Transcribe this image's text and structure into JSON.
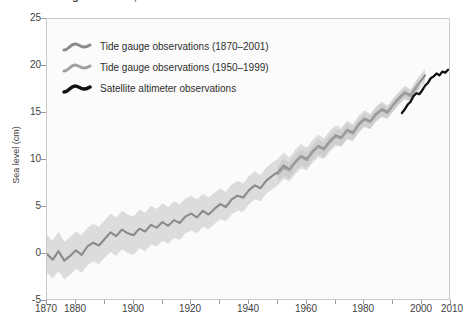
{
  "title": "Global average sea level, 1870-2010",
  "axes": {
    "ylabel": "Sea level (cm)",
    "xlabel": "",
    "yticks": [
      25,
      20,
      15,
      10,
      5,
      0,
      -5
    ],
    "ytick_labels": [
      "25",
      "20",
      "15",
      "10",
      "5",
      "0",
      "-5"
    ],
    "xticks": [
      1870,
      1880,
      1890,
      1900,
      1910,
      1920,
      1930,
      1940,
      1950,
      1960,
      1970,
      1980,
      1990,
      2000,
      2010
    ],
    "xtick_labels_shown": [
      "1870",
      "1880",
      "1900",
      "1920",
      "1940",
      "1960",
      "1980",
      "2000",
      "2010"
    ],
    "xlim": [
      1870,
      2010
    ],
    "ylim": [
      -5,
      25
    ],
    "grid": false
  },
  "legend": {
    "position": "top-left-inside",
    "items": [
      {
        "label": "Tide gauge observations (1870–2001)",
        "color": "#8a8a8a"
      },
      {
        "label": "Tide gauge observations (1950–1999)",
        "color": "#a0a0a0"
      },
      {
        "label": "Satellite altimeter observations",
        "color": "#111111"
      }
    ]
  },
  "colors": {
    "band_outer": "#dcdcdc",
    "band_inner": "#cfcfcf",
    "series1": "#8a8a8a",
    "series2": "#a0a0a0",
    "series3": "#111111",
    "frame": "#c9c9c9",
    "background": "#fbfbfb",
    "text": "#3f3f3f"
  },
  "chart_data": {
    "type": "line",
    "title": "Global average sea level, 1870-2010",
    "xlabel": "",
    "ylabel": "Sea level (cm)",
    "xlim": [
      1870,
      2010
    ],
    "ylim": [
      -5,
      25
    ],
    "grid": false,
    "legend_position": "upper left",
    "series": [
      {
        "name": "Tide gauge observations (1870–2001)",
        "color": "#8a8a8a",
        "uncertainty_band": true,
        "x": [
          1870,
          1872,
          1874,
          1876,
          1878,
          1880,
          1882,
          1884,
          1886,
          1888,
          1890,
          1892,
          1894,
          1896,
          1898,
          1900,
          1902,
          1904,
          1906,
          1908,
          1910,
          1912,
          1914,
          1916,
          1918,
          1920,
          1922,
          1924,
          1926,
          1928,
          1930,
          1932,
          1934,
          1936,
          1938,
          1940,
          1942,
          1944,
          1946,
          1948,
          1950,
          1952,
          1954,
          1956,
          1958,
          1960,
          1962,
          1964,
          1966,
          1968,
          1970,
          1972,
          1974,
          1976,
          1978,
          1980,
          1982,
          1984,
          1986,
          1988,
          1990,
          1992,
          1994,
          1996,
          1998,
          2000,
          2001
        ],
        "y": [
          0.0,
          -0.6,
          0.3,
          -0.7,
          -0.2,
          0.4,
          -0.1,
          0.8,
          1.2,
          0.9,
          1.6,
          2.3,
          1.9,
          2.6,
          2.2,
          2.0,
          2.7,
          2.4,
          3.1,
          2.8,
          3.4,
          3.0,
          3.6,
          3.3,
          4.0,
          4.3,
          3.9,
          4.6,
          4.2,
          4.8,
          5.3,
          5.0,
          5.8,
          6.2,
          6.0,
          6.8,
          7.3,
          7.0,
          7.8,
          8.3,
          8.7,
          9.4,
          9.0,
          9.8,
          10.4,
          10.1,
          10.9,
          11.5,
          11.2,
          12.0,
          12.6,
          12.4,
          13.2,
          12.9,
          13.8,
          14.4,
          14.1,
          14.9,
          15.4,
          15.1,
          15.9,
          16.6,
          17.2,
          16.9,
          17.8,
          18.6,
          19.0
        ],
        "y_lower": [
          -2.0,
          -2.6,
          -1.8,
          -2.7,
          -2.2,
          -1.6,
          -2.0,
          -1.2,
          -0.8,
          -1.1,
          -0.4,
          0.2,
          -0.2,
          0.5,
          0.1,
          -0.1,
          0.6,
          0.3,
          1.0,
          0.8,
          1.4,
          1.1,
          1.7,
          1.5,
          2.2,
          2.5,
          2.2,
          2.9,
          2.6,
          3.2,
          3.7,
          3.5,
          4.2,
          4.6,
          4.5,
          5.3,
          5.8,
          5.6,
          6.4,
          6.9,
          7.3,
          8.0,
          7.7,
          8.5,
          9.1,
          8.9,
          9.7,
          10.3,
          10.1,
          10.9,
          11.5,
          11.4,
          12.2,
          12.0,
          12.9,
          13.5,
          13.3,
          14.1,
          14.6,
          14.4,
          15.2,
          15.9,
          16.5,
          16.3,
          17.1,
          17.9,
          18.3
        ],
        "y_upper": [
          2.0,
          1.4,
          2.4,
          1.3,
          1.8,
          2.4,
          2.0,
          2.8,
          3.2,
          2.9,
          3.6,
          4.3,
          3.9,
          4.6,
          4.2,
          4.0,
          4.7,
          4.4,
          5.1,
          4.8,
          5.4,
          5.0,
          5.6,
          5.3,
          5.9,
          6.2,
          5.8,
          6.4,
          6.0,
          6.5,
          7.0,
          6.6,
          7.4,
          7.8,
          7.5,
          8.3,
          8.8,
          8.4,
          9.2,
          9.7,
          10.1,
          10.8,
          10.3,
          11.1,
          11.7,
          11.3,
          12.1,
          12.7,
          12.3,
          13.1,
          13.7,
          13.4,
          14.2,
          13.8,
          14.7,
          15.3,
          14.9,
          15.7,
          16.2,
          15.8,
          16.6,
          17.3,
          17.9,
          17.5,
          18.5,
          19.3,
          19.7
        ]
      },
      {
        "name": "Tide gauge observations (1950–1999)",
        "color": "#a0a0a0",
        "uncertainty_band": true,
        "x": [
          1950,
          1952,
          1954,
          1956,
          1958,
          1960,
          1962,
          1964,
          1966,
          1968,
          1970,
          1972,
          1974,
          1976,
          1978,
          1980,
          1982,
          1984,
          1986,
          1988,
          1990,
          1992,
          1994,
          1996,
          1998,
          1999
        ],
        "y": [
          8.5,
          9.2,
          8.9,
          9.7,
          10.3,
          10.0,
          10.8,
          11.4,
          11.1,
          11.9,
          12.5,
          12.3,
          13.1,
          12.8,
          13.7,
          14.3,
          14.0,
          14.8,
          15.3,
          15.0,
          15.8,
          16.5,
          17.1,
          16.8,
          17.7,
          18.2
        ],
        "y_lower": [
          7.6,
          8.3,
          8.0,
          8.8,
          9.4,
          9.2,
          10.0,
          10.6,
          10.3,
          11.1,
          11.7,
          11.5,
          12.3,
          12.1,
          13.0,
          13.6,
          13.3,
          14.1,
          14.6,
          14.4,
          15.2,
          15.9,
          16.5,
          16.2,
          17.1,
          17.6
        ],
        "y_upper": [
          9.4,
          10.1,
          9.8,
          10.6,
          11.2,
          10.8,
          11.6,
          12.2,
          11.9,
          12.7,
          13.3,
          13.1,
          13.9,
          13.5,
          14.4,
          15.0,
          14.7,
          15.5,
          16.0,
          15.6,
          16.4,
          17.1,
          17.7,
          17.4,
          18.3,
          18.8
        ]
      },
      {
        "name": "Satellite altimeter observations",
        "color": "#111111",
        "uncertainty_band": false,
        "x": [
          1993,
          1994,
          1995,
          1996,
          1997,
          1998,
          1999,
          2000,
          2001,
          2002,
          2003,
          2004,
          2005,
          2006,
          2007,
          2008,
          2009
        ],
        "y": [
          15.0,
          15.4,
          15.9,
          16.2,
          16.8,
          17.1,
          17.0,
          17.4,
          17.9,
          18.2,
          18.7,
          18.9,
          19.2,
          19.0,
          19.4,
          19.3,
          19.6
        ]
      }
    ]
  }
}
